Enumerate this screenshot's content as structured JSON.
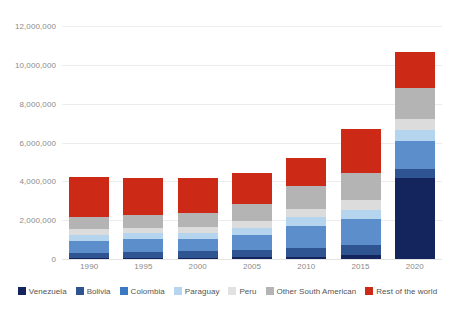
{
  "chart_data": {
    "type": "bar",
    "stacked": true,
    "title": "",
    "subtitle": "",
    "xlabel": "",
    "ylabel": "",
    "grid": true,
    "legend_position": "bottom",
    "categories": [
      "1990",
      "1995",
      "2000",
      "2005",
      "2010",
      "2015",
      "2020"
    ],
    "ylim": [
      0,
      12000000
    ],
    "yticks": [
      0,
      2000000,
      4000000,
      6000000,
      8000000,
      10000000,
      12000000
    ],
    "ytick_labels": [
      "0",
      "2,000,000",
      "4,000,000",
      "6,000,000",
      "8,000,000",
      "10,000,000",
      "12,000,000"
    ],
    "series": [
      {
        "name": "Venezuela",
        "color": "#13255c",
        "values": [
          42000,
          49000,
          57000,
          81000,
          115000,
          186000,
          4170000
        ]
      },
      {
        "name": "Bolivia",
        "color": "#2e5591",
        "values": [
          290000,
          320000,
          340000,
          390000,
          430000,
          530000,
          480000
        ]
      },
      {
        "name": "Colombia",
        "color": "#5b8ecb",
        "values": [
          620000,
          650000,
          640000,
          760000,
          1180000,
          1320000,
          1430000
        ]
      },
      {
        "name": "Paraguay",
        "color": "#b5d5ef",
        "values": [
          300000,
          300000,
          320000,
          360000,
          430000,
          480000,
          540000
        ]
      },
      {
        "name": "Peru",
        "color": "#dcdcdc",
        "values": [
          270000,
          280000,
          290000,
          380000,
          440000,
          520000,
          580000
        ]
      },
      {
        "name": "Other South American",
        "color": "#b4b4b4",
        "values": [
          660000,
          690000,
          740000,
          890000,
          1160000,
          1420000,
          1620000
        ]
      },
      {
        "name": "Rest of the world",
        "color": "#cc2a16",
        "values": [
          2060000,
          1900000,
          1780000,
          1580000,
          1430000,
          2240000,
          1820000
        ]
      }
    ],
    "totals": [
      4242000,
      4189000,
      4167000,
      4441000,
      5185000,
      6696000,
      10640000
    ]
  },
  "legend": {
    "items": [
      {
        "label": "Venezuela",
        "color": "#13255c"
      },
      {
        "label": "Bolivia",
        "color": "#2e5591"
      },
      {
        "label": "Colombia",
        "color": "#3b79c4"
      },
      {
        "label": "Paraguay",
        "color": "#b5d5ef"
      },
      {
        "label": "Peru",
        "color": "#e2e2e2"
      },
      {
        "label": "Other South American",
        "color": "#b4b4b4"
      },
      {
        "label": "Rest of the world",
        "color": "#cc2a16"
      }
    ]
  }
}
